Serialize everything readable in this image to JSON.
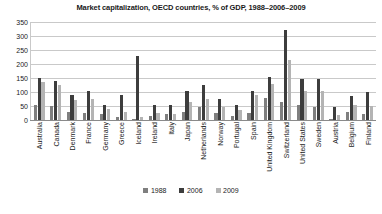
{
  "chart_data": {
    "type": "bar",
    "title": "Market capitalization, OECD countries, % of GDP, 1988–2006–2009",
    "xlabel": "",
    "ylabel": "",
    "ylim": [
      0,
      350
    ],
    "yticks": [
      350,
      300,
      250,
      200,
      150,
      100,
      50,
      0
    ],
    "grid": true,
    "legend_position": "bottom",
    "categories": [
      "Australia",
      "Canada",
      "Denmark",
      "France",
      "Germany",
      "Greece",
      "Iceland",
      "Ireland",
      "Italy",
      "Japan",
      "Netherlands",
      "Norway",
      "Portugal",
      "Spain",
      "United Kingdom",
      "Switzerland",
      "United States",
      "Sweden",
      "Austria",
      "Belgium",
      "Finland"
    ],
    "series": [
      {
        "name": "1988",
        "color": "#7f7f7f",
        "values": [
          55,
          50,
          30,
          25,
          20,
          10,
          5,
          15,
          20,
          30,
          45,
          25,
          15,
          25,
          80,
          65,
          55,
          45,
          5,
          30,
          20
        ]
      },
      {
        "name": "2006",
        "color": "#3d3d3d",
        "values": [
          150,
          140,
          90,
          105,
          55,
          90,
          230,
          55,
          55,
          105,
          125,
          75,
          55,
          105,
          155,
          320,
          145,
          145,
          45,
          85,
          100
        ]
      },
      {
        "name": "2009",
        "color": "#b4b4b4",
        "values": [
          135,
          125,
          70,
          75,
          40,
          30,
          10,
          25,
          20,
          65,
          75,
          45,
          35,
          90,
          130,
          215,
          105,
          105,
          18,
          55,
          50
        ]
      }
    ]
  },
  "legend": {
    "items": [
      {
        "label": "1988"
      },
      {
        "label": "2006"
      },
      {
        "label": "2009"
      }
    ]
  }
}
